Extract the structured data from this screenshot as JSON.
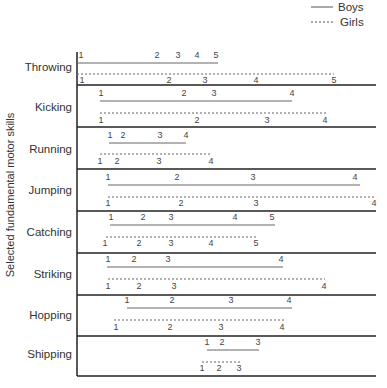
{
  "chart_data": {
    "type": "timeline",
    "title": "",
    "ylabel": "Selected fundamental motor skills",
    "xlabel": "",
    "legend": {
      "position": "top-right",
      "entries": [
        {
          "name": "Boys",
          "style": "solid"
        },
        {
          "name": "Girls",
          "style": "dashed"
        }
      ]
    },
    "categories": [
      "Throwing",
      "Kicking",
      "Running",
      "Jumping",
      "Catching",
      "Striking",
      "Hopping",
      "Shipping"
    ],
    "series": [
      {
        "name": "Boys",
        "style": "solid",
        "rows": [
          {
            "skill": "Throwing",
            "stages": [
              "1",
              "2",
              "3",
              "4",
              "5"
            ],
            "x": [
              81,
              157,
              178,
              197,
              216
            ],
            "line": [
              77,
              218
            ]
          },
          {
            "skill": "Kicking",
            "stages": [
              "1",
              "2",
              "3",
              "4"
            ],
            "x": [
              101,
              184,
              214,
              292
            ],
            "line": [
              100,
              292
            ]
          },
          {
            "skill": "Running",
            "stages": [
              "1",
              "2",
              "3",
              "4"
            ],
            "x": [
              110,
              123,
              160,
              186
            ],
            "line": [
              109,
              186
            ]
          },
          {
            "skill": "Jumping",
            "stages": [
              "1",
              "2",
              "3",
              "4"
            ],
            "x": [
              108,
              177,
              253,
              355
            ],
            "line": [
              108,
              360
            ]
          },
          {
            "skill": "Catching",
            "stages": [
              "1",
              "2",
              "3",
              "4",
              "5"
            ],
            "x": [
              111,
              143,
              171,
              235,
              272
            ],
            "line": [
              110,
              275
            ]
          },
          {
            "skill": "Striking",
            "stages": [
              "1",
              "2",
              "3",
              "4"
            ],
            "x": [
              108,
              134,
              168,
              281
            ],
            "line": [
              107,
              283
            ]
          },
          {
            "skill": "Hopping",
            "stages": [
              "1",
              "2",
              "3",
              "4"
            ],
            "x": [
              127,
              172,
              231,
              289
            ],
            "line": [
              127,
              292
            ]
          },
          {
            "skill": "Shipping",
            "stages": [
              "1",
              "2",
              "3"
            ],
            "x": [
              207,
              222,
              258
            ],
            "line": [
              207,
              259
            ]
          }
        ]
      },
      {
        "name": "Girls",
        "style": "dashed",
        "rows": [
          {
            "skill": "Throwing",
            "stages": [
              "1",
              "2",
              "3",
              "4",
              "5"
            ],
            "x": [
              82,
              169,
              205,
              256,
              334
            ],
            "line": [
              77,
              334
            ]
          },
          {
            "skill": "Kicking",
            "stages": [
              "1",
              "2",
              "3",
              "4"
            ],
            "x": [
              101,
              197,
              267,
              325
            ],
            "line": [
              100,
              326
            ]
          },
          {
            "skill": "Running",
            "stages": [
              "1",
              "2",
              "3",
              "4"
            ],
            "x": [
              100,
              117,
              159,
              211
            ],
            "line": [
              100,
              211
            ]
          },
          {
            "skill": "Jumping",
            "stages": [
              "1",
              "2",
              "3",
              "4"
            ],
            "x": [
              108,
              181,
              256,
              374
            ],
            "line": [
              108,
              375
            ]
          },
          {
            "skill": "Catching",
            "stages": [
              "1",
              "2",
              "3",
              "4",
              "5"
            ],
            "x": [
              105,
              139,
              171,
              211,
              256
            ],
            "line": [
              106,
              256
            ]
          },
          {
            "skill": "Striking",
            "stages": [
              "1",
              "2",
              "3",
              "4"
            ],
            "x": [
              108,
              139,
              174,
              324
            ],
            "line": [
              108,
              325
            ]
          },
          {
            "skill": "Hopping",
            "stages": [
              "1",
              "2",
              "3",
              "4"
            ],
            "x": [
              116,
              170,
              221,
              282
            ],
            "line": [
              114,
              284
            ]
          },
          {
            "skill": "Shipping",
            "stages": [
              "1",
              "2",
              "3"
            ],
            "x": [
              202,
              219,
              239
            ],
            "line": [
              202,
              240
            ]
          }
        ]
      }
    ],
    "layout": {
      "axis_x": 77,
      "axis_top": 52,
      "right_edge": 376,
      "row_bounds": [
        [
          52,
          85
        ],
        [
          85,
          127
        ],
        [
          127,
          169
        ],
        [
          169,
          211
        ],
        [
          211,
          253
        ],
        [
          253,
          295
        ],
        [
          295,
          336
        ],
        [
          336,
          376
        ]
      ],
      "boys_line_y": [
        63,
        101,
        143,
        185,
        225,
        267,
        308,
        350
      ],
      "boys_label_y": [
        58,
        96,
        138,
        180,
        220,
        262,
        303,
        345
      ],
      "girls_line_y": [
        74,
        113,
        154,
        197,
        237,
        279,
        320,
        362
      ],
      "girls_label_y": [
        83,
        123,
        164,
        206,
        246,
        289,
        330,
        371
      ],
      "row_label_y": [
        71,
        111,
        153,
        194,
        236,
        278,
        319,
        358
      ],
      "grid": false
    }
  },
  "legend": {
    "boys_label": "Boys",
    "girls_label": "Girls"
  },
  "axis": {
    "ylabel": "Selected fundamental motor skills"
  }
}
